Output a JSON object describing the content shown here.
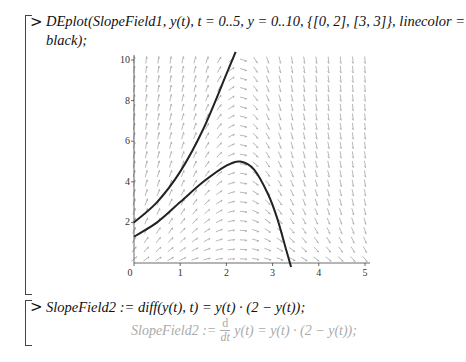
{
  "worksheet": {
    "cell1": {
      "prompt": ">",
      "command_line1": "DEplot(SlopeField1, y(t), t = 0..5, y = 0..10, {[0, 2], [3, 3]}, linecolor =",
      "command_line2": "black);"
    },
    "cell2": {
      "prompt": ">",
      "command": "SlopeField2 := diff(y(t), t) = y(t) · (2 − y(t));",
      "output_lhs": "SlopeField2 :=",
      "output_frac_num": "d",
      "output_frac_den": "dt",
      "output_rhs": "y(t) = y(t) · (2 − y(t));"
    }
  },
  "chart_data": {
    "type": "line",
    "title": "",
    "xlabel": "",
    "ylabel": "",
    "xlim": [
      0,
      5
    ],
    "ylim": [
      0,
      10
    ],
    "x_ticks": [
      "0",
      "1",
      "2",
      "3",
      "4",
      "5"
    ],
    "y_ticks": [
      "2",
      "4",
      "6",
      "8",
      "10"
    ],
    "grid": false,
    "series": [
      {
        "name": "solution through (0,2)",
        "color": "#222222",
        "x": [
          0,
          0.5,
          1.0,
          1.5,
          2.0,
          2.2
        ],
        "y": [
          2.0,
          3.0,
          4.5,
          6.6,
          9.3,
          10.4
        ]
      },
      {
        "name": "solution through (0,1.3)",
        "color": "#222222",
        "x": [
          0,
          0.5,
          1.0,
          1.5,
          2.0,
          2.3,
          2.6,
          2.9,
          3.1,
          3.3,
          3.4
        ],
        "y": [
          1.3,
          2.0,
          3.0,
          4.0,
          4.8,
          5.0,
          4.6,
          3.4,
          2.2,
          0.6,
          -0.2
        ]
      }
    ],
    "field_color": "#999999",
    "curve_color": "#222222"
  }
}
